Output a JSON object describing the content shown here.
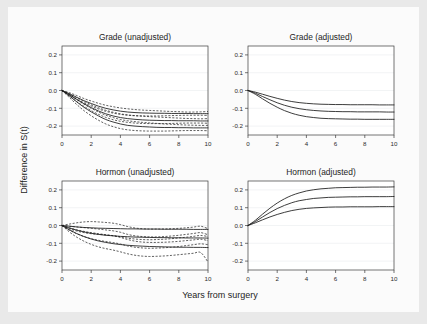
{
  "figure": {
    "background_color": "#e9e9e9",
    "canvas_color": "#fbfbfb",
    "panel_color": "#ffffff",
    "line_color": "#1a1a1a",
    "grid_color": "#eceff1",
    "axis_color": "#3b3b3b",
    "xlabel": "Years from surgery",
    "ylabel": "Difference in S(t)"
  },
  "axes": {
    "xlim": [
      0,
      10
    ],
    "ylim": [
      -0.25,
      0.25
    ],
    "xticks": [
      0,
      2,
      4,
      6,
      8,
      10
    ],
    "xticklabels": [
      "0",
      "2",
      "4",
      "6",
      "8",
      "10"
    ],
    "yticks": [
      0.2,
      0.1,
      0.0,
      -0.1,
      -0.2
    ],
    "yticklabels": [
      "0.2",
      "0.1",
      "0.0",
      "-0.1",
      "-0.2"
    ],
    "grid": true,
    "legend": "none"
  },
  "chart_data": [
    {
      "type": "line",
      "panel": "top-left",
      "title": "Grade (unadjusted)",
      "xlabel": "Years from surgery",
      "ylabel": "Difference in S(t)",
      "xlim": [
        0,
        10
      ],
      "ylim": [
        -0.25,
        0.25
      ],
      "xticks": [
        0,
        2,
        4,
        6,
        8,
        10
      ],
      "yticks": [
        0.2,
        0.1,
        0.0,
        -0.1,
        -0.2
      ],
      "x": [
        0,
        0.5,
        1,
        1.5,
        2,
        2.5,
        3,
        3.5,
        4,
        4.5,
        5,
        5.5,
        6,
        6.5,
        7,
        7.5,
        8,
        8.5,
        9,
        9.5,
        10
      ],
      "series": [
        {
          "name": "estimate-upper",
          "style": "solid",
          "values": [
            0.0,
            -0.018,
            -0.038,
            -0.057,
            -0.073,
            -0.088,
            -0.1,
            -0.109,
            -0.116,
            -0.121,
            -0.124,
            -0.126,
            -0.127,
            -0.128,
            -0.128,
            -0.129,
            -0.129,
            -0.129,
            -0.13,
            -0.13,
            -0.13
          ]
        },
        {
          "name": "estimate-middle",
          "style": "solid",
          "values": [
            0.0,
            -0.024,
            -0.05,
            -0.074,
            -0.096,
            -0.115,
            -0.131,
            -0.143,
            -0.152,
            -0.158,
            -0.162,
            -0.165,
            -0.167,
            -0.168,
            -0.169,
            -0.169,
            -0.17,
            -0.17,
            -0.17,
            -0.171,
            -0.171
          ]
        },
        {
          "name": "estimate-lower",
          "style": "solid",
          "values": [
            0.0,
            -0.03,
            -0.063,
            -0.094,
            -0.12,
            -0.143,
            -0.163,
            -0.177,
            -0.188,
            -0.196,
            -0.2,
            -0.203,
            -0.205,
            -0.207,
            -0.208,
            -0.208,
            -0.209,
            -0.209,
            -0.21,
            -0.21,
            -0.21
          ]
        },
        {
          "name": "ci-upper-1",
          "style": "dashed",
          "values": [
            0.0,
            -0.012,
            -0.028,
            -0.045,
            -0.059,
            -0.072,
            -0.083,
            -0.091,
            -0.098,
            -0.103,
            -0.107,
            -0.11,
            -0.112,
            -0.114,
            -0.116,
            -0.118,
            -0.119,
            -0.121,
            -0.121,
            -0.12,
            -0.118
          ]
        },
        {
          "name": "ci-lower-1",
          "style": "dashed",
          "values": [
            0.0,
            -0.024,
            -0.048,
            -0.069,
            -0.087,
            -0.104,
            -0.117,
            -0.127,
            -0.134,
            -0.139,
            -0.142,
            -0.143,
            -0.143,
            -0.143,
            -0.142,
            -0.141,
            -0.14,
            -0.139,
            -0.139,
            -0.139,
            -0.14
          ]
        },
        {
          "name": "ci-upper-2",
          "style": "dashed",
          "values": [
            0.0,
            -0.018,
            -0.04,
            -0.061,
            -0.08,
            -0.097,
            -0.111,
            -0.122,
            -0.131,
            -0.137,
            -0.141,
            -0.144,
            -0.147,
            -0.149,
            -0.151,
            -0.153,
            -0.155,
            -0.157,
            -0.158,
            -0.159,
            -0.158
          ]
        },
        {
          "name": "ci-lower-2",
          "style": "dashed",
          "values": [
            0.0,
            -0.031,
            -0.062,
            -0.089,
            -0.113,
            -0.134,
            -0.151,
            -0.164,
            -0.173,
            -0.179,
            -0.183,
            -0.185,
            -0.186,
            -0.186,
            -0.186,
            -0.185,
            -0.184,
            -0.183,
            -0.183,
            -0.183,
            -0.184
          ]
        },
        {
          "name": "ci-upper-3",
          "style": "dashed",
          "values": [
            0.0,
            -0.022,
            -0.05,
            -0.077,
            -0.1,
            -0.121,
            -0.139,
            -0.152,
            -0.163,
            -0.17,
            -0.175,
            -0.179,
            -0.182,
            -0.185,
            -0.188,
            -0.19,
            -0.192,
            -0.194,
            -0.195,
            -0.196,
            -0.196
          ]
        },
        {
          "name": "ci-lower-3",
          "style": "dashed",
          "values": [
            0.0,
            -0.039,
            -0.078,
            -0.113,
            -0.142,
            -0.167,
            -0.188,
            -0.203,
            -0.214,
            -0.221,
            -0.225,
            -0.227,
            -0.228,
            -0.228,
            -0.228,
            -0.227,
            -0.226,
            -0.225,
            -0.225,
            -0.225,
            -0.226
          ]
        }
      ]
    },
    {
      "type": "line",
      "panel": "top-right",
      "title": "Grade (adjusted)",
      "xlabel": "Years from surgery",
      "ylabel": "Difference in S(t)",
      "xlim": [
        0,
        10
      ],
      "ylim": [
        -0.25,
        0.25
      ],
      "xticks": [
        0,
        2,
        4,
        6,
        8,
        10
      ],
      "yticks": [
        0.2,
        0.1,
        0.0,
        -0.1,
        -0.2
      ],
      "x": [
        0,
        0.5,
        1,
        1.5,
        2,
        2.5,
        3,
        3.5,
        4,
        4.5,
        5,
        5.5,
        6,
        6.5,
        7,
        7.5,
        8,
        8.5,
        9,
        9.5,
        10
      ],
      "series": [
        {
          "name": "curve-upper",
          "style": "solid",
          "values": [
            0.0,
            -0.009,
            -0.021,
            -0.033,
            -0.044,
            -0.054,
            -0.062,
            -0.068,
            -0.072,
            -0.075,
            -0.077,
            -0.078,
            -0.079,
            -0.079,
            -0.08,
            -0.08,
            -0.08,
            -0.08,
            -0.081,
            -0.081,
            -0.081
          ]
        },
        {
          "name": "curve-middle",
          "style": "solid",
          "values": [
            0.0,
            -0.015,
            -0.034,
            -0.052,
            -0.069,
            -0.083,
            -0.094,
            -0.102,
            -0.108,
            -0.112,
            -0.115,
            -0.117,
            -0.118,
            -0.119,
            -0.119,
            -0.12,
            -0.12,
            -0.12,
            -0.12,
            -0.121,
            -0.121
          ]
        },
        {
          "name": "curve-lower",
          "style": "solid",
          "values": [
            0.0,
            -0.021,
            -0.047,
            -0.072,
            -0.094,
            -0.113,
            -0.128,
            -0.139,
            -0.147,
            -0.152,
            -0.156,
            -0.158,
            -0.159,
            -0.16,
            -0.161,
            -0.161,
            -0.162,
            -0.162,
            -0.162,
            -0.162,
            -0.162
          ]
        }
      ]
    },
    {
      "type": "line",
      "panel": "bottom-left",
      "title": "Hormon (unadjusted)",
      "xlabel": "Years from surgery",
      "ylabel": "Difference in S(t)",
      "xlim": [
        0,
        10
      ],
      "ylim": [
        -0.25,
        0.25
      ],
      "xticks": [
        0,
        2,
        4,
        6,
        8,
        10
      ],
      "yticks": [
        0.2,
        0.1,
        0.0,
        -0.1,
        -0.2
      ],
      "x": [
        0,
        0.5,
        1,
        1.5,
        2,
        2.5,
        3,
        3.5,
        4,
        4.5,
        5,
        5.5,
        6,
        6.5,
        7,
        7.5,
        8,
        8.5,
        9,
        9.5,
        10
      ],
      "series": [
        {
          "name": "estimate-upper",
          "style": "solid",
          "values": [
            0.0,
            -0.004,
            -0.008,
            -0.011,
            -0.013,
            -0.015,
            -0.016,
            -0.017,
            -0.018,
            -0.019,
            -0.019,
            -0.02,
            -0.02,
            -0.02,
            -0.021,
            -0.021,
            -0.021,
            -0.021,
            -0.022,
            -0.022,
            -0.022
          ]
        },
        {
          "name": "estimate-middle",
          "style": "solid",
          "values": [
            0.0,
            -0.014,
            -0.026,
            -0.036,
            -0.044,
            -0.05,
            -0.055,
            -0.058,
            -0.061,
            -0.063,
            -0.065,
            -0.066,
            -0.067,
            -0.068,
            -0.068,
            -0.069,
            -0.069,
            -0.07,
            -0.07,
            -0.07,
            -0.071
          ]
        },
        {
          "name": "estimate-lower",
          "style": "solid",
          "values": [
            0.0,
            -0.024,
            -0.045,
            -0.062,
            -0.076,
            -0.087,
            -0.095,
            -0.102,
            -0.107,
            -0.111,
            -0.114,
            -0.116,
            -0.118,
            -0.119,
            -0.12,
            -0.121,
            -0.122,
            -0.122,
            -0.123,
            -0.123,
            -0.124
          ]
        },
        {
          "name": "ci-upper-1",
          "style": "dashed",
          "values": [
            0.0,
            0.008,
            0.015,
            0.02,
            0.022,
            0.02,
            0.017,
            0.013,
            0.005,
            -0.006,
            -0.014,
            -0.018,
            -0.02,
            -0.02,
            -0.019,
            -0.018,
            -0.016,
            -0.013,
            -0.009,
            -0.004,
            -0.018
          ]
        },
        {
          "name": "ci-lower-1",
          "style": "dashed",
          "values": [
            0.0,
            -0.018,
            -0.031,
            -0.04,
            -0.046,
            -0.05,
            -0.053,
            -0.057,
            -0.063,
            -0.071,
            -0.076,
            -0.079,
            -0.08,
            -0.079,
            -0.077,
            -0.074,
            -0.07,
            -0.066,
            -0.061,
            -0.056,
            -0.062
          ]
        },
        {
          "name": "ci-upper-2",
          "style": "dashed",
          "values": [
            0.0,
            -0.004,
            -0.008,
            -0.012,
            -0.016,
            -0.02,
            -0.025,
            -0.03,
            -0.038,
            -0.05,
            -0.058,
            -0.062,
            -0.064,
            -0.064,
            -0.062,
            -0.059,
            -0.055,
            -0.05,
            -0.045,
            -0.04,
            -0.052
          ]
        },
        {
          "name": "ci-lower-2",
          "style": "dashed",
          "values": [
            0.0,
            -0.026,
            -0.046,
            -0.062,
            -0.074,
            -0.083,
            -0.09,
            -0.096,
            -0.104,
            -0.115,
            -0.122,
            -0.126,
            -0.128,
            -0.127,
            -0.125,
            -0.122,
            -0.118,
            -0.113,
            -0.108,
            -0.103,
            -0.108
          ]
        },
        {
          "name": "ci-upper-3",
          "style": "dashed",
          "values": [
            0.0,
            -0.013,
            -0.024,
            -0.033,
            -0.04,
            -0.046,
            -0.052,
            -0.058,
            -0.067,
            -0.079,
            -0.088,
            -0.093,
            -0.095,
            -0.095,
            -0.094,
            -0.092,
            -0.089,
            -0.085,
            -0.081,
            -0.077,
            -0.085
          ]
        },
        {
          "name": "ci-lower-3",
          "style": "dashed",
          "values": [
            0.0,
            -0.036,
            -0.065,
            -0.088,
            -0.106,
            -0.12,
            -0.13,
            -0.138,
            -0.148,
            -0.159,
            -0.167,
            -0.172,
            -0.174,
            -0.173,
            -0.171,
            -0.168,
            -0.164,
            -0.16,
            -0.156,
            -0.152,
            -0.205
          ]
        }
      ]
    },
    {
      "type": "line",
      "panel": "bottom-right",
      "title": "Hormon (adjusted)",
      "xlabel": "Years from surgery",
      "ylabel": "Difference in S(t)",
      "xlim": [
        0,
        10
      ],
      "ylim": [
        -0.25,
        0.25
      ],
      "xticks": [
        0,
        2,
        4,
        6,
        8,
        10
      ],
      "yticks": [
        0.2,
        0.1,
        0.0,
        -0.1,
        -0.2
      ],
      "x": [
        0,
        0.5,
        1,
        1.5,
        2,
        2.5,
        3,
        3.5,
        4,
        4.5,
        5,
        5.5,
        6,
        6.5,
        7,
        7.5,
        8,
        8.5,
        9,
        9.5,
        10
      ],
      "series": [
        {
          "name": "curve-upper",
          "style": "solid",
          "values": [
            0.0,
            0.029,
            0.064,
            0.097,
            0.126,
            0.15,
            0.169,
            0.183,
            0.194,
            0.201,
            0.206,
            0.209,
            0.212,
            0.213,
            0.214,
            0.215,
            0.215,
            0.216,
            0.216,
            0.216,
            0.217
          ]
        },
        {
          "name": "curve-middle",
          "style": "solid",
          "values": [
            0.0,
            0.022,
            0.048,
            0.073,
            0.095,
            0.113,
            0.128,
            0.139,
            0.146,
            0.152,
            0.155,
            0.158,
            0.159,
            0.16,
            0.161,
            0.161,
            0.162,
            0.162,
            0.162,
            0.162,
            0.163
          ]
        },
        {
          "name": "curve-lower",
          "style": "solid",
          "values": [
            0.0,
            0.015,
            0.032,
            0.048,
            0.062,
            0.074,
            0.084,
            0.091,
            0.096,
            0.099,
            0.101,
            0.103,
            0.104,
            0.104,
            0.105,
            0.105,
            0.105,
            0.105,
            0.106,
            0.106,
            0.106
          ]
        }
      ]
    }
  ]
}
